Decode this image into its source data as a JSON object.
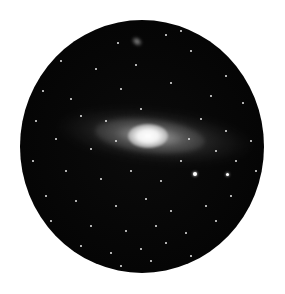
{
  "image": {
    "subject": "Andromeda galaxy in circular telescope field of view",
    "frame_shape": "circle",
    "background_color": "#ffffff",
    "sky_color": "#050505",
    "core_color": "#ffffff"
  },
  "bright_stars": [
    {
      "x": 173,
      "y": 152,
      "size": 4
    },
    {
      "x": 206,
      "y": 153,
      "size": 3
    }
  ],
  "stars": [
    [
      30,
      12
    ],
    [
      58,
      10
    ],
    [
      97,
      22
    ],
    [
      145,
      14
    ],
    [
      160,
      10
    ],
    [
      40,
      40
    ],
    [
      75,
      48
    ],
    [
      115,
      44
    ],
    [
      170,
      30
    ],
    [
      205,
      55
    ],
    [
      22,
      70
    ],
    [
      50,
      78
    ],
    [
      100,
      68
    ],
    [
      150,
      62
    ],
    [
      190,
      75
    ],
    [
      222,
      82
    ],
    [
      15,
      100
    ],
    [
      35,
      118
    ],
    [
      205,
      110
    ],
    [
      230,
      120
    ],
    [
      12,
      140
    ],
    [
      45,
      150
    ],
    [
      80,
      158
    ],
    [
      110,
      150
    ],
    [
      140,
      160
    ],
    [
      160,
      140
    ],
    [
      215,
      140
    ],
    [
      235,
      150
    ],
    [
      25,
      175
    ],
    [
      55,
      180
    ],
    [
      95,
      185
    ],
    [
      125,
      178
    ],
    [
      150,
      190
    ],
    [
      185,
      185
    ],
    [
      210,
      175
    ],
    [
      30,
      200
    ],
    [
      70,
      205
    ],
    [
      105,
      210
    ],
    [
      135,
      205
    ],
    [
      165,
      212
    ],
    [
      195,
      200
    ],
    [
      60,
      225
    ],
    [
      90,
      232
    ],
    [
      120,
      228
    ],
    [
      145,
      222
    ],
    [
      170,
      235
    ],
    [
      100,
      245
    ],
    [
      130,
      240
    ],
    [
      85,
      100
    ],
    [
      60,
      95
    ],
    [
      180,
      98
    ],
    [
      195,
      130
    ],
    [
      120,
      88
    ],
    [
      70,
      128
    ],
    [
      168,
      118
    ],
    [
      95,
      120
    ]
  ]
}
